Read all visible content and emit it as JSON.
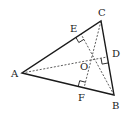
{
  "diagram": {
    "type": "geometry",
    "vertices": {
      "A": {
        "label": "A",
        "x": 22,
        "y": 73
      },
      "B": {
        "label": "B",
        "x": 114,
        "y": 95
      },
      "C": {
        "label": "C",
        "x": 101,
        "y": 21
      }
    },
    "feet": {
      "D": {
        "label": "D",
        "on": "BC",
        "x": 107,
        "y": 57
      },
      "E": {
        "label": "E",
        "on": "AC",
        "x": 81,
        "y": 34
      },
      "F": {
        "label": "F",
        "on": "AB",
        "x": 84,
        "y": 88
      }
    },
    "intersection": {
      "label": "O",
      "x": 92,
      "y": 59
    },
    "segments": {
      "solid": [
        "AB",
        "BC",
        "CA"
      ],
      "dashed": [
        "AD",
        "BE",
        "CF"
      ]
    },
    "right_angle_marks": [
      "E",
      "D",
      "F"
    ],
    "colors": {
      "line": "#1a1a1a",
      "background": "#ffffff"
    }
  }
}
